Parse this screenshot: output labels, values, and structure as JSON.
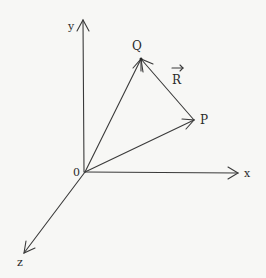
{
  "diagram": {
    "title": "",
    "colors": {
      "background": "#f7f7f5",
      "stroke": "#3a3a3a",
      "text": "#2a2a2a"
    },
    "origin": {
      "label": "0",
      "x": 85,
      "y": 172
    },
    "axes": [
      {
        "name": "x",
        "label": "x",
        "end": {
          "x": 238,
          "y": 173
        }
      },
      {
        "name": "y",
        "label": "y",
        "end": {
          "x": 83,
          "y": 20
        }
      },
      {
        "name": "z",
        "label": "z",
        "end": {
          "x": 24,
          "y": 253
        }
      }
    ],
    "points": [
      {
        "name": "P",
        "label": "P",
        "x": 194,
        "y": 120
      },
      {
        "name": "Q",
        "label": "Q",
        "x": 141,
        "y": 59
      }
    ],
    "vectors": [
      {
        "name": "OP",
        "from": "origin",
        "to": "P"
      },
      {
        "name": "OQ",
        "from": "origin",
        "to": "Q"
      },
      {
        "name": "PQ",
        "from": "P",
        "to": "Q",
        "label": "R"
      }
    ],
    "vector_label": {
      "text": "R",
      "arrow": "→"
    }
  }
}
